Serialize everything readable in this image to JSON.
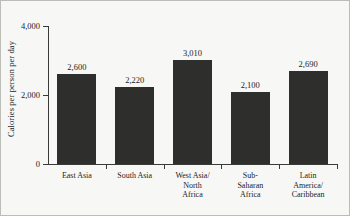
{
  "chart_data": {
    "type": "bar",
    "title": "",
    "xlabel": "",
    "ylabel": "Calories per person per day",
    "categories": [
      "East Asia",
      "South Asia",
      "West Asia/\nNorth\nAfrica",
      "Sub-\nSaharan\nAfrica",
      "Latin\nAmerica/\nCaribbean"
    ],
    "values": [
      2600,
      2220,
      3010,
      2100,
      2690
    ],
    "value_labels": [
      "2,600",
      "2,220",
      "3,010",
      "2,100",
      "2,690"
    ],
    "ylim": [
      0,
      4000
    ],
    "yticks": [
      0,
      2000,
      4000
    ],
    "ytick_labels": [
      "0",
      "2,000",
      "4,000"
    ],
    "grid": false,
    "legend": "none",
    "bar_color": "#2e2e2c",
    "axis_color": "#3a3a38",
    "background_color": "#f7f7f5",
    "text_color": "#1d1d1d"
  }
}
